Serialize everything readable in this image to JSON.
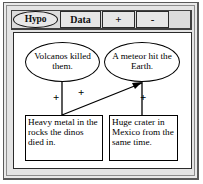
{
  "window": {
    "title": ""
  },
  "toolbar": {
    "buttons": [
      {
        "id": "hypo",
        "label": "Hypo",
        "shape": "oval",
        "selected": true
      },
      {
        "id": "data",
        "label": "Data",
        "shape": "rect",
        "selected": false
      },
      {
        "id": "plus",
        "label": "+",
        "shape": "rect",
        "selected": false
      },
      {
        "id": "minus",
        "label": "-",
        "shape": "rect",
        "selected": false
      }
    ]
  },
  "canvas": {
    "nodes": [
      {
        "id": "volcanos",
        "kind": "hypothesis",
        "shape": "ellipse",
        "text": "Volcanos killed them."
      },
      {
        "id": "meteor",
        "kind": "hypothesis",
        "shape": "ellipse",
        "text": "A meteor hit the Earth."
      },
      {
        "id": "heavy-metal",
        "kind": "data",
        "shape": "rect",
        "text": "Heavy metal in the rocks the dinos died in."
      },
      {
        "id": "crater",
        "kind": "data",
        "shape": "rect",
        "text": "Huge crater in Mexico from the same time."
      }
    ],
    "links": [
      {
        "id": "link-volcanos-heavy",
        "from": "volcanos",
        "to": "heavy-metal",
        "sign": "+",
        "arrow": false
      },
      {
        "id": "link-heavy-meteor",
        "from": "heavy-metal",
        "to": "meteor",
        "sign": "+",
        "arrow": true
      },
      {
        "id": "link-meteor-crater",
        "from": "meteor",
        "to": "crater",
        "sign": "+",
        "arrow": false
      }
    ]
  },
  "colors": {
    "stroke": "#000000",
    "canvas_bg": "#ffffff",
    "window_bg": "#e4e4e4",
    "toolbar_bg": "#dcdcdc",
    "button_bg": "#e6e6e6"
  }
}
